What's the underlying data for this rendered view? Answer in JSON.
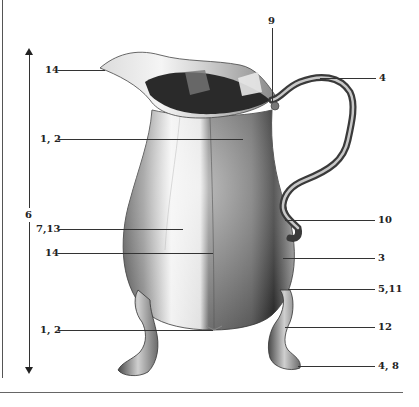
{
  "diagram": {
    "height_dimension_label": "6",
    "callouts_left": [
      {
        "label": "14",
        "target": "spout lip"
      },
      {
        "label": "1, 2",
        "target": "neck"
      },
      {
        "label": "7,13",
        "target": "body panel"
      },
      {
        "label": "14",
        "target": "body seam"
      },
      {
        "label": "1, 2",
        "target": "base"
      }
    ],
    "callouts_right": [
      {
        "label": "9",
        "target": "handle join at rim"
      },
      {
        "label": "4",
        "target": "handle top scroll"
      },
      {
        "label": "10",
        "target": "handle lower join"
      },
      {
        "label": "3",
        "target": "body side"
      },
      {
        "label": "5,11",
        "target": "leg join"
      },
      {
        "label": "12",
        "target": "knee"
      },
      {
        "label": "4, 8",
        "target": "foot"
      }
    ],
    "colors": {
      "line": "#333333",
      "text": "#222222",
      "silver_light": "#e8e8e8",
      "silver_mid": "#a0a0a0",
      "silver_dark": "#4a4a4a"
    }
  }
}
